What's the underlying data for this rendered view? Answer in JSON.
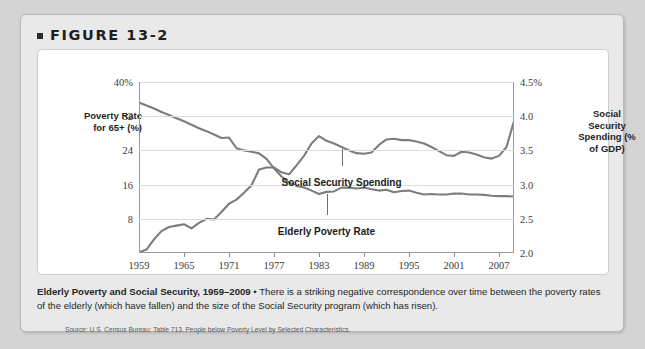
{
  "figure": {
    "label": "FIGURE 13-2",
    "bullet_icon": "square-bullet-icon"
  },
  "caption": {
    "title": "Elderly Poverty and Social Security, 1959–2009",
    "separator": " • ",
    "body": "There is a striking negative correspondence over time between the poverty rates of the elderly (which have fallen) and the size of the Social Security program (which has risen)."
  },
  "source": "Source: U.S. Census Bureau: Table 713. People below Poverty Level by Selected Characteristics.",
  "colors": {
    "line": "#7d7d7d",
    "grid": "#dcdcdc",
    "axis": "#9a9a9a",
    "panel_background": "#ffffff",
    "card_background": "#e9e9e9",
    "page_background": "#d4d4d4"
  },
  "chart_data": {
    "type": "line",
    "title": "Elderly Poverty and Social Security, 1959–2009",
    "xlabel": "",
    "grid": true,
    "legend_position": "inline-annotation",
    "x": [
      1959,
      1960,
      1961,
      1962,
      1963,
      1964,
      1965,
      1966,
      1967,
      1968,
      1969,
      1970,
      1971,
      1972,
      1973,
      1974,
      1975,
      1976,
      1977,
      1978,
      1979,
      1980,
      1981,
      1982,
      1983,
      1984,
      1985,
      1986,
      1987,
      1988,
      1989,
      1990,
      1991,
      1992,
      1993,
      1994,
      1995,
      1996,
      1997,
      1998,
      1999,
      2000,
      2001,
      2002,
      2003,
      2004,
      2005,
      2006,
      2007,
      2008,
      2009
    ],
    "xticks": [
      1959,
      1965,
      1971,
      1977,
      1983,
      1989,
      1995,
      2001,
      2007
    ],
    "left_axis": {
      "label": "Poverty Rate for 65+ (%)",
      "ticks": [
        "40%",
        "32",
        "24",
        "16",
        "8"
      ],
      "tick_values": [
        40,
        32,
        24,
        16,
        8
      ],
      "ylim": [
        0,
        40
      ]
    },
    "right_axis": {
      "label": "Social Security Spending (% of GDP)",
      "ticks": [
        "4.5%",
        "4.0",
        "3.5",
        "3.0",
        "2.5",
        "2.0"
      ],
      "tick_values": [
        4.5,
        4.0,
        3.5,
        3.0,
        2.5,
        2.0
      ],
      "ylim": [
        2.0,
        4.5
      ]
    },
    "series": [
      {
        "name": "Elderly Poverty Rate",
        "axis": "left",
        "units": "% of 65+ population in poverty",
        "values": [
          35.2,
          34.5,
          33.8,
          33.0,
          32.3,
          31.5,
          30.8,
          30.0,
          29.2,
          28.5,
          27.7,
          26.9,
          27.0,
          24.5,
          24.0,
          23.7,
          23.3,
          22.0,
          19.8,
          17.9,
          16.5,
          15.7,
          15.3,
          14.6,
          13.8,
          14.3,
          14.4,
          15.3,
          15.3,
          15.1,
          15.3,
          14.9,
          14.6,
          14.8,
          14.2,
          14.5,
          14.6,
          14.1,
          13.7,
          13.8,
          13.7,
          13.7,
          13.9,
          13.9,
          13.7,
          13.7,
          13.6,
          13.4,
          13.3,
          13.3,
          13.2
        ]
      },
      {
        "name": "Social Security Spending",
        "axis": "right",
        "units": "% of GDP",
        "values": [
          2.01,
          2.05,
          2.2,
          2.32,
          2.38,
          2.4,
          2.42,
          2.36,
          2.44,
          2.5,
          2.49,
          2.6,
          2.72,
          2.78,
          2.88,
          2.99,
          3.22,
          3.25,
          3.25,
          3.18,
          3.15,
          3.28,
          3.42,
          3.6,
          3.71,
          3.64,
          3.6,
          3.55,
          3.5,
          3.46,
          3.45,
          3.47,
          3.58,
          3.66,
          3.67,
          3.65,
          3.65,
          3.63,
          3.6,
          3.55,
          3.49,
          3.43,
          3.42,
          3.48,
          3.47,
          3.44,
          3.4,
          3.38,
          3.42,
          3.55,
          3.93
        ]
      }
    ],
    "annotations": [
      {
        "text": "Social Security Spending",
        "x": 1986,
        "note": "label below SS line with leader"
      },
      {
        "text": "Elderly Poverty Rate",
        "x": 1984,
        "note": "label below poverty line with leader"
      }
    ]
  }
}
